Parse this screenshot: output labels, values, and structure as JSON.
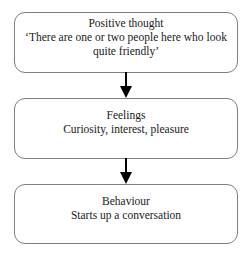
{
  "diagram": {
    "type": "flowchart",
    "orientation": "vertical",
    "border_color": "#808080",
    "text_color": "#1a1a1a",
    "arrow_color": "#000000",
    "nodes": [
      {
        "id": "positive-thought",
        "title": "Positive thought",
        "body": "‘There are one or two people here who look quite friendly’"
      },
      {
        "id": "feelings",
        "title": "Feelings",
        "body": "Curiosity, interest, pleasure"
      },
      {
        "id": "behaviour",
        "title": "Behaviour",
        "body": "Starts up a conversation"
      }
    ],
    "connectors": [
      {
        "id": "arrow-thought-to-feelings",
        "from": "positive-thought",
        "to": "feelings",
        "shape": "arrow-down"
      },
      {
        "id": "arrow-feelings-to-behaviour",
        "from": "feelings",
        "to": "behaviour",
        "shape": "arrow-down"
      }
    ]
  }
}
